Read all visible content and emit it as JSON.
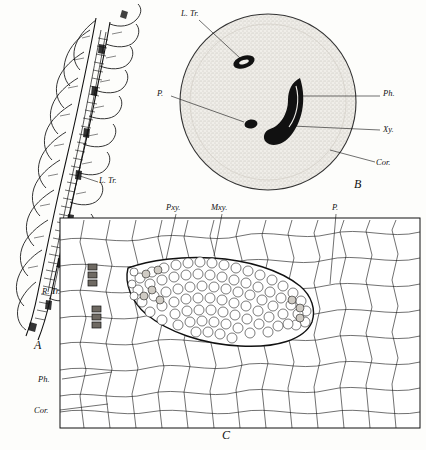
{
  "figure": {
    "panels": [
      {
        "id": "A",
        "label": "A",
        "x": 36,
        "y": 348
      },
      {
        "id": "B",
        "label": "B",
        "x": 356,
        "y": 186
      },
      {
        "id": "C",
        "label": "C",
        "x": 224,
        "y": 437
      }
    ],
    "labels": [
      {
        "name": "L. Tr.",
        "text": "L. Tr.",
        "x": 183,
        "y": 14,
        "panel": "B"
      },
      {
        "name": "P.",
        "text": "P.",
        "x": 159,
        "y": 94,
        "panel": "B"
      },
      {
        "name": "Ph.",
        "text": "Ph.",
        "x": 384,
        "y": 94,
        "panel": "B"
      },
      {
        "name": "Xy.",
        "text": "Xy.",
        "x": 384,
        "y": 131,
        "panel": "B"
      },
      {
        "name": "Cor.",
        "text": "Cor.",
        "x": 379,
        "y": 164,
        "panel": "B"
      },
      {
        "name": "L. Tr.",
        "text": "L. Tr.",
        "x": 100,
        "y": 182,
        "panel": "A"
      },
      {
        "name": "R. Tr.",
        "text": "R. Tr.",
        "x": 44,
        "y": 292,
        "panel": "A"
      },
      {
        "name": "Pxy.",
        "text": "Pxy.",
        "x": 168,
        "y": 209,
        "panel": "C"
      },
      {
        "name": "Mxy.",
        "text": "Mxy.",
        "x": 213,
        "y": 209,
        "panel": "C"
      },
      {
        "name": "P.",
        "text": "P.",
        "x": 334,
        "y": 209,
        "panel": "C"
      },
      {
        "name": "Ph.",
        "text": "Ph.",
        "x": 41,
        "y": 381,
        "panel": "C"
      },
      {
        "name": "Cor.",
        "text": "Cor.",
        "x": 38,
        "y": 412,
        "panel": "C"
      }
    ]
  }
}
